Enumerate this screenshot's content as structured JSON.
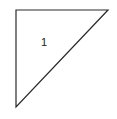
{
  "diagram": {
    "type": "right-triangle",
    "vertices": [
      [
        16,
        10
      ],
      [
        108,
        10
      ],
      [
        16,
        107
      ]
    ],
    "stroke_color": "#2a2a2a",
    "fill_color": "#ffffff",
    "label": {
      "text": "1",
      "x": 44,
      "y": 46
    }
  }
}
